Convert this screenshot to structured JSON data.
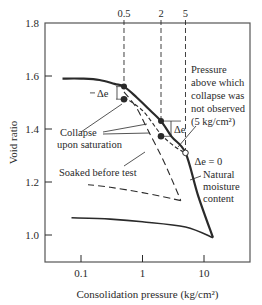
{
  "chart_data": {
    "type": "line",
    "title": "",
    "xlabel": "Consolidation pressure (kg/cm²)",
    "ylabel": "Void ratio",
    "xscale": "log",
    "xlim": [
      0.035,
      60
    ],
    "ylim": [
      0.9,
      1.8
    ],
    "x_ticks": [
      {
        "value": 0.1,
        "label": "0.1"
      },
      {
        "value": 1,
        "label": "1"
      },
      {
        "value": 10,
        "label": "10"
      }
    ],
    "y_ticks": [
      {
        "value": 1.0,
        "label": "1.0"
      },
      {
        "value": 1.2,
        "label": "1.2"
      },
      {
        "value": 1.4,
        "label": "1.4"
      },
      {
        "value": 1.6,
        "label": "1.6"
      },
      {
        "value": 1.8,
        "label": "1.8"
      }
    ],
    "top_ticks": [
      {
        "value": 0.5,
        "label": "0.5"
      },
      {
        "value": 2,
        "label": "2"
      },
      {
        "value": 5,
        "label": "5"
      }
    ],
    "grid": false,
    "series": [
      {
        "name": "Natural moisture content (loading)",
        "style": "solid-thick",
        "points": [
          [
            0.05,
            1.59
          ],
          [
            0.1,
            1.59
          ],
          [
            0.2,
            1.585
          ],
          [
            0.35,
            1.57
          ],
          [
            0.5,
            1.56
          ],
          [
            0.8,
            1.52
          ],
          [
            1.2,
            1.48
          ],
          [
            2,
            1.43
          ],
          [
            3,
            1.37
          ],
          [
            5,
            1.31
          ],
          [
            8,
            1.15
          ],
          [
            14,
            0.99
          ]
        ]
      },
      {
        "name": "Natural moisture content (unloading)",
        "style": "solid",
        "points": [
          [
            14,
            0.99
          ],
          [
            5,
            1.03
          ],
          [
            1,
            1.05
          ],
          [
            0.3,
            1.06
          ],
          [
            0.07,
            1.065
          ]
        ]
      },
      {
        "name": "Collapse upon saturation path",
        "style": "short-dash",
        "points": [
          [
            0.5,
            1.52
          ],
          [
            1,
            1.47
          ],
          [
            2,
            1.38
          ],
          [
            3.5,
            1.33
          ],
          [
            5,
            1.31
          ]
        ]
      },
      {
        "name": "Soaked before test (loading)",
        "style": "long-dash",
        "points": [
          [
            0.5,
            1.54
          ],
          [
            0.8,
            1.48
          ],
          [
            1.2,
            1.4
          ],
          [
            2,
            1.3
          ],
          [
            3,
            1.21
          ],
          [
            4.2,
            1.13
          ]
        ]
      },
      {
        "name": "Soaked before test (unloading)",
        "style": "long-dash",
        "points": [
          [
            4.2,
            1.13
          ],
          [
            1,
            1.16
          ],
          [
            0.3,
            1.18
          ],
          [
            0.13,
            1.19
          ]
        ]
      }
    ],
    "collapse_points": [
      {
        "pressure": 0.5,
        "e_before": 1.56,
        "e_after": 1.52,
        "label": "Δe"
      },
      {
        "pressure": 2,
        "e_before": 1.43,
        "e_after": 1.38,
        "label": "Δe"
      },
      {
        "pressure": 5,
        "e_before": 1.31,
        "e_after": 1.31,
        "label": "Δe = 0"
      }
    ],
    "annotations": [
      {
        "text": "Collapse",
        "line2": "upon saturation"
      },
      {
        "text": "Soaked before test"
      },
      {
        "text": "Pressure",
        "lines": [
          "Pressure",
          "above which",
          "collapse was",
          "not observed",
          "(5 kg/cm²)"
        ]
      },
      {
        "text": "Natural",
        "lines": [
          "Natural",
          "moisture",
          "content"
        ]
      },
      {
        "text": "Δe = 0"
      }
    ]
  }
}
